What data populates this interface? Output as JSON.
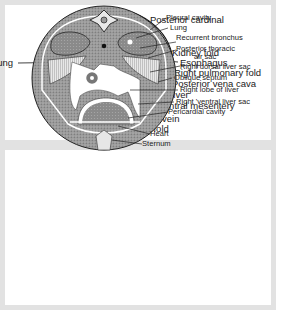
{
  "figures": [
    {
      "id": "top",
      "description": "Cross-section of early embryo showing pulmonary and kidney folds",
      "labels": {
        "posterior_cardinal": "Posterior cardinal",
        "kidney_fold": "Kidney fold",
        "esophagus": "Esophagus",
        "right_pulmonary_fold": "Right pulmonary fold",
        "posterior_vena_cava": "Posterior vena cava",
        "liver": "Liver",
        "ventral_mesentery": "Ventral mesentery",
        "left_umbilical_vein": "Left umbilical vein",
        "left_pulmonary_fold": "Left pulmonary fold",
        "lung": "Lung"
      }
    },
    {
      "id": "bottom",
      "description": "Cross-section of thorax showing body cavities and air sacs",
      "labels": {
        "pleural_cavity": "Pleural cavity",
        "lung": "Lung",
        "recurrent_bronchus": "Recurrent bronchus",
        "posterior_thoracic_air_sac_1": "Posterior thoracic",
        "posterior_thoracic_air_sac_2": "air sac",
        "right_dorsal_liver_sac": "Right dorsal liver sac",
        "oblique_septum": "Oblique septum",
        "right_lobe_of_liver": "Right lobe of liver",
        "right_ventral_liver_sac": "Right 'ventral liver sac",
        "pericardial_cavity": "Pericardial cavity",
        "heart": "Heart",
        "sternum": "Sternum"
      }
    }
  ],
  "colors": {
    "frame": "#e2e2e2",
    "ink": "#1a1a1a",
    "stipple_dark": "#555555",
    "stipple_mid": "#8a8a8a",
    "stipple_light": "#b5b5b5"
  }
}
